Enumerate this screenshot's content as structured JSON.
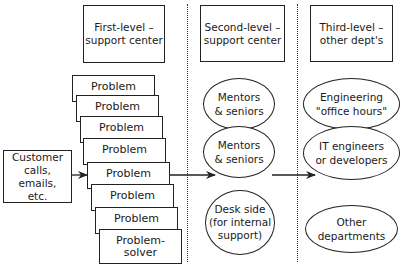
{
  "headers": {
    "first": "First-level –\nsupport center",
    "second": "Second-level –\nsupport center",
    "third": "Third-level –\nother dept's"
  },
  "customer": "Customer\ncalls, emails,\netc.",
  "first_level": {
    "problems": [
      "Problem",
      "Problem",
      "Problem",
      "Problem",
      "Problem",
      "Problem",
      "Problem",
      "Problem-\nsolver"
    ]
  },
  "second_level": {
    "items": [
      "Mentors\n& seniors",
      "Mentors\n& seniors",
      "Desk side\n(for internal\nsupport)"
    ]
  },
  "third_level": {
    "items": [
      "Engineering\n\"office hours\"",
      "IT engineers\nor developers",
      "Other\ndepartments"
    ]
  },
  "colors": {
    "line": "#222222",
    "background": "#ffffff"
  }
}
